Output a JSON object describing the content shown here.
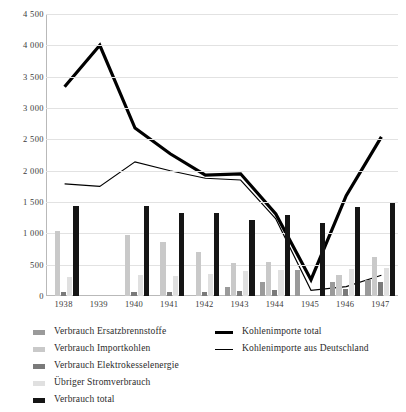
{
  "chart_data": {
    "type": "bar",
    "title": "",
    "subtitle": "",
    "xlabel": "",
    "ylabel": "",
    "categories": [
      "1938",
      "1939",
      "1940",
      "1941",
      "1942",
      "1943",
      "1944",
      "1945",
      "1946",
      "1947"
    ],
    "ylim": [
      0,
      4500
    ],
    "yticks": [
      0,
      500,
      1000,
      1500,
      2000,
      2500,
      3000,
      3500,
      4000,
      4500
    ],
    "ytick_labels": [
      "0",
      "500",
      "1 000",
      "1 500",
      "2 000",
      "2 500",
      "3 000",
      "3 500",
      "4 000",
      "4 500"
    ],
    "grid": true,
    "legend_position": "bottom",
    "series": [
      {
        "name": "Verbrauch Ersatzbrennstoffe",
        "kind": "bar",
        "color": "#9a9a9a",
        "values": [
          0,
          0,
          0,
          0,
          0,
          150,
          230,
          420,
          225,
          260
        ]
      },
      {
        "name": "Verbrauch Importkohlen",
        "kind": "bar",
        "color": "#c9c9c9",
        "values": [
          1030,
          0,
          980,
          860,
          710,
          520,
          545,
          0,
          330,
          620
        ]
      },
      {
        "name": "Verbrauch Elektrokesselenergie",
        "kind": "bar",
        "color": "#7a7a7a",
        "values": [
          70,
          0,
          70,
          65,
          70,
          75,
          95,
          0,
          110,
          225
        ]
      },
      {
        "name": "Übriger Stromverbrauch",
        "kind": "bar",
        "color": "#e0e0e0",
        "values": [
          310,
          0,
          330,
          325,
          350,
          400,
          420,
          0,
          430,
          440
        ]
      },
      {
        "name": "Verbrauch total",
        "kind": "bar",
        "color": "#151515",
        "values": [
          1440,
          0,
          1440,
          1330,
          1320,
          1220,
          1290,
          1160,
          1420,
          1490
        ]
      },
      {
        "name": "Kohlenimporte total",
        "kind": "line",
        "color": "#000000",
        "width": 3.2,
        "values": [
          3340,
          4000,
          2680,
          2270,
          1930,
          1950,
          1310,
          260,
          1600,
          2540
        ]
      },
      {
        "name": "Kohlenimporte aus Deutschland",
        "kind": "line",
        "color": "#000000",
        "width": 1.1,
        "values": [
          1790,
          1750,
          2140,
          2000,
          1880,
          1850,
          1230,
          90,
          150,
          330
        ]
      }
    ]
  },
  "legend": {
    "left_items": [
      {
        "label": "Verbrauch Ersatzbrennstoffe",
        "color": "#9a9a9a"
      },
      {
        "label": "Verbrauch Importkohlen",
        "color": "#c9c9c9"
      },
      {
        "label": "Verbrauch Elektrokesselenergie",
        "color": "#7a7a7a"
      },
      {
        "label": "Übriger Stromverbrauch",
        "color": "#e0e0e0"
      },
      {
        "label": "Verbrauch total",
        "color": "#151515"
      }
    ],
    "right_items": [
      {
        "label": "Kohlenimporte total",
        "style": "thick"
      },
      {
        "label": "Kohlenimporte aus Deutschland",
        "style": "thin"
      }
    ]
  }
}
